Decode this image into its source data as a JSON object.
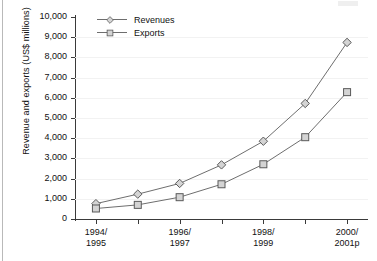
{
  "chart_data": {
    "type": "line",
    "title": "",
    "xlabel": "",
    "ylabel": "Revenue and exports (US$ millions)",
    "ylim": [
      0,
      10000
    ],
    "ytick_labels": [
      "10,000",
      "9,000",
      "8,000",
      "7,000",
      "6,000",
      "5,000",
      "4,000",
      "3,000",
      "2,000",
      "1,000",
      "0"
    ],
    "ytick_values": [
      10000,
      9000,
      8000,
      7000,
      6000,
      5000,
      4000,
      3000,
      2000,
      1000,
      0
    ],
    "grid": true,
    "grid_axis": "y",
    "legend_position": "top-left",
    "categories": [
      "1994/1995",
      "",
      "1996/1997",
      "",
      "1998/1999",
      "",
      "2000/2001p"
    ],
    "xtick_labels": [
      {
        "line1": "1994/",
        "line2": "1995"
      },
      {
        "line1": "",
        "line2": ""
      },
      {
        "line1": "1996/",
        "line2": "1997"
      },
      {
        "line1": "",
        "line2": ""
      },
      {
        "line1": "1998/",
        "line2": "1999"
      },
      {
        "line1": "",
        "line2": ""
      },
      {
        "line1": "2000/",
        "line2": "2001p"
      }
    ],
    "series": [
      {
        "name": "Revenues",
        "marker": "diamond",
        "color": "#6e6e6e",
        "marker_fill": "#d4d4d4",
        "values": [
          760,
          1230,
          1760,
          2680,
          3850,
          5720,
          8740
        ]
      },
      {
        "name": "Exports",
        "marker": "square",
        "color": "#6e6e6e",
        "marker_fill": "#d4d4d4",
        "values": [
          520,
          700,
          1080,
          1720,
          2710,
          4050,
          6280
        ]
      }
    ]
  },
  "legend": {
    "items": [
      {
        "label": "Revenues",
        "marker": "diamond"
      },
      {
        "label": "Exports",
        "marker": "square"
      }
    ]
  }
}
